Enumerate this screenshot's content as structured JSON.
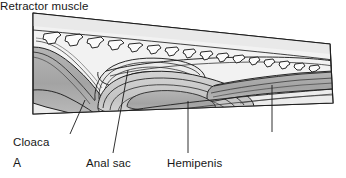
{
  "figure": {
    "panel_letter": "A",
    "labels": [
      {
        "id": "cloaca",
        "text": "Cloaca",
        "leader": {
          "x1": 70,
          "y1": 134,
          "x2": 85,
          "y2": 100
        }
      },
      {
        "id": "anal_sac",
        "text": "Anal sac",
        "leader": {
          "x1": 113,
          "y1": 153,
          "x2": 128,
          "y2": 70
        }
      },
      {
        "id": "hemipenis",
        "text": "Hemipenis",
        "leader": {
          "x1": 188,
          "y1": 153,
          "x2": 188,
          "y2": 101
        }
      },
      {
        "id": "retractor_muscle",
        "text": "Retractor muscle",
        "leader": {
          "x1": 272,
          "y1": 132,
          "x2": 272,
          "y2": 85
        }
      }
    ],
    "colors": {
      "background": "#ffffff",
      "outline": "#1a1a1a",
      "body_wall_light": "#f0f0f0",
      "tissue_pale": "#e3e3e3",
      "tissue_mid": "#c9c9c9",
      "tissue_dark": "#a8a8a8",
      "vertebra_fill": "#fafafa",
      "label_text": "#171717"
    },
    "structures": [
      {
        "name": "vertebral-column",
        "element_count": 14,
        "description": "row of caudal vertebrae along dorsal margin"
      },
      {
        "name": "cloaca",
        "description": "dark grey chamber at anterior/left, opening ventrally"
      },
      {
        "name": "anal-sac",
        "description": "coiled pale sac anterior to hemipenis base"
      },
      {
        "name": "hemipenis",
        "description": "large inverted sac occupying tail base"
      },
      {
        "name": "retractor-muscle",
        "description": "mid-grey muscular band extending posteriorly into tail"
      }
    ]
  }
}
